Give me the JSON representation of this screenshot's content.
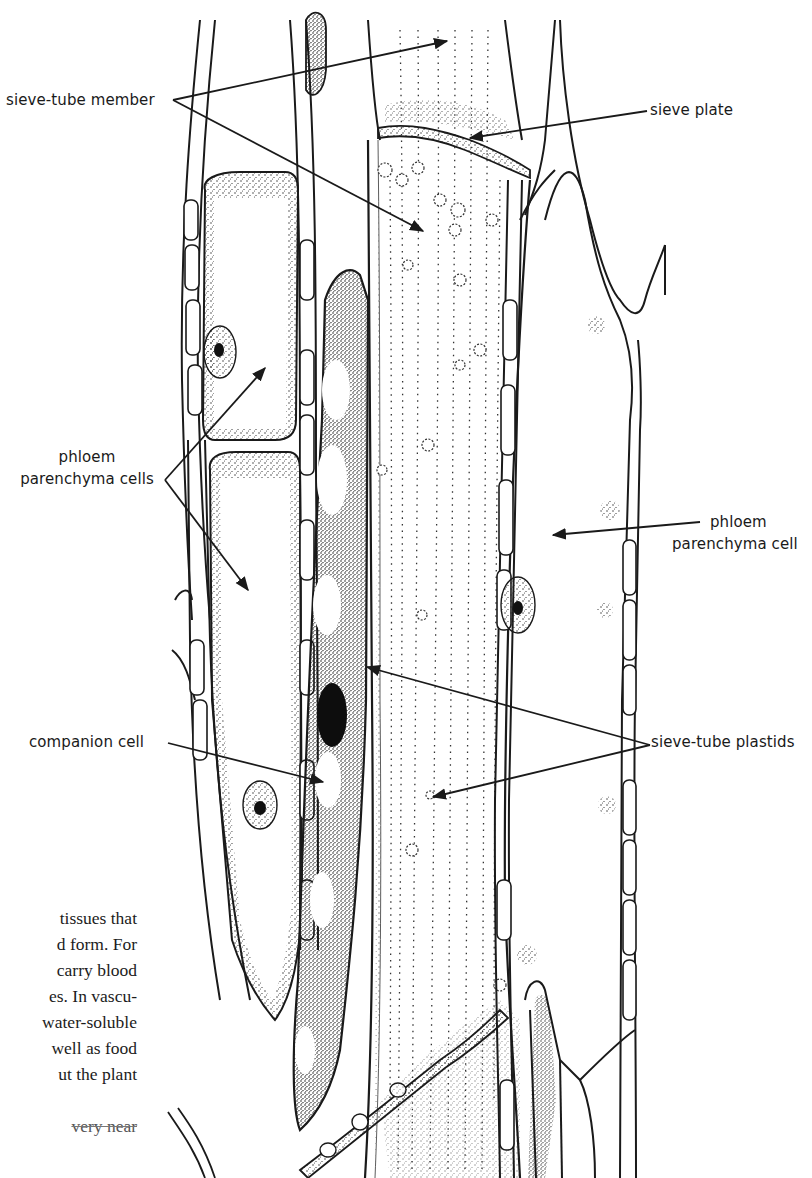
{
  "figure": {
    "labels": {
      "sieve_tube_member": "sieve-tube member",
      "sieve_plate": "sieve plate",
      "phloem_parenchyma_cells_line1": "phloem",
      "phloem_parenchyma_cells_line2": "parenchyma cells",
      "phloem_parenchyma_cell_line1": "phloem",
      "phloem_parenchyma_cell_line2": "parenchyma cell",
      "companion_cell": "companion cell",
      "sieve_tube_plastids": "sieve-tube plastids"
    },
    "colors": {
      "ink": "#1a1a1a",
      "stipple": "#2b2b2b",
      "paper": "#ffffff"
    }
  },
  "body_text": {
    "lines": [
      "tissues that",
      "d form. For",
      "carry blood",
      "es. In vascu-",
      "water-soluble",
      "well as food",
      "ut the plant",
      "",
      "very near"
    ]
  }
}
